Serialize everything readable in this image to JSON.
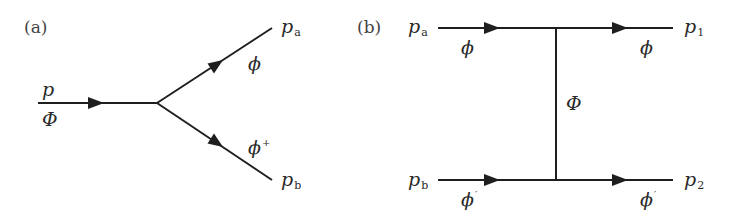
{
  "diagram_a": {
    "panel_label": "(a)",
    "incoming": {
      "momentum": "p",
      "field": "Φ"
    },
    "outgoing_top": {
      "momentum": "p",
      "momentum_sub": "a",
      "field": "ϕ"
    },
    "outgoing_bottom": {
      "momentum": "p",
      "momentum_sub": "b",
      "field": "ϕ",
      "field_sup": "+"
    }
  },
  "diagram_b": {
    "panel_label": "(b)",
    "top_in": {
      "momentum": "p",
      "momentum_sub": "a",
      "field": "ϕ"
    },
    "top_out": {
      "momentum": "p",
      "momentum_sub": "1",
      "field": "ϕ"
    },
    "bottom_in": {
      "momentum": "p",
      "momentum_sub": "b",
      "field": "ϕ",
      "field_sup": "′"
    },
    "bottom_out": {
      "momentum": "p",
      "momentum_sub": "2",
      "field": "ϕ",
      "field_sup": "′"
    },
    "exchange": {
      "field": "Φ"
    }
  },
  "colors": {
    "line": "#1f1f1f",
    "text": "#2a2a2a",
    "background": "#ffffff"
  }
}
